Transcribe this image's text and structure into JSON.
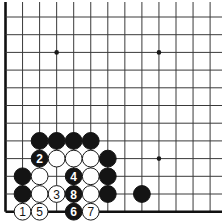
{
  "board": {
    "origin_x": 5.5,
    "origin_y": 17,
    "spacing_x": 17.05,
    "spacing_y": 17.7,
    "cols": 13,
    "rows": 12,
    "line_top": 2,
    "line_right": 222,
    "left_edge": true,
    "bottom_edge": true,
    "stone_radius": 8.4,
    "colors": {
      "black": "#141414",
      "white": "#ffffff",
      "line": "#3a3a3a"
    }
  },
  "star_points": [
    {
      "col": 3,
      "row": 2
    },
    {
      "col": 9,
      "row": 2
    },
    {
      "col": 9,
      "row": 8
    },
    {
      "col": 3,
      "row": 8
    }
  ],
  "stones": [
    {
      "col": 2,
      "row": 7,
      "color": "black",
      "label": ""
    },
    {
      "col": 3,
      "row": 7,
      "color": "black",
      "label": ""
    },
    {
      "col": 4,
      "row": 7,
      "color": "black",
      "label": ""
    },
    {
      "col": 5,
      "row": 7,
      "color": "black",
      "label": ""
    },
    {
      "col": 2,
      "row": 8,
      "color": "black",
      "label": "2"
    },
    {
      "col": 3,
      "row": 8,
      "color": "white",
      "label": ""
    },
    {
      "col": 4,
      "row": 8,
      "color": "white",
      "label": ""
    },
    {
      "col": 5,
      "row": 8,
      "color": "white",
      "label": ""
    },
    {
      "col": 6,
      "row": 8,
      "color": "black",
      "label": ""
    },
    {
      "col": 1,
      "row": 9,
      "color": "black",
      "label": ""
    },
    {
      "col": 2,
      "row": 9,
      "color": "white",
      "label": ""
    },
    {
      "col": 4,
      "row": 9,
      "color": "black",
      "label": "4"
    },
    {
      "col": 5,
      "row": 9,
      "color": "white",
      "label": ""
    },
    {
      "col": 6,
      "row": 9,
      "color": "black",
      "label": ""
    },
    {
      "col": 1,
      "row": 10,
      "color": "black",
      "label": ""
    },
    {
      "col": 2,
      "row": 10,
      "color": "white",
      "label": ""
    },
    {
      "col": 3,
      "row": 10,
      "color": "white",
      "label": "3"
    },
    {
      "col": 4,
      "row": 10,
      "color": "black",
      "label": "8"
    },
    {
      "col": 5,
      "row": 10,
      "color": "white",
      "label": ""
    },
    {
      "col": 6,
      "row": 10,
      "color": "black",
      "label": ""
    },
    {
      "col": 8,
      "row": 10,
      "color": "black",
      "label": ""
    },
    {
      "col": 1,
      "row": 11,
      "color": "white",
      "label": "1"
    },
    {
      "col": 2,
      "row": 11,
      "color": "white",
      "label": "5"
    },
    {
      "col": 4,
      "row": 11,
      "color": "black",
      "label": "6"
    },
    {
      "col": 5,
      "row": 11,
      "color": "white",
      "label": "7"
    }
  ]
}
